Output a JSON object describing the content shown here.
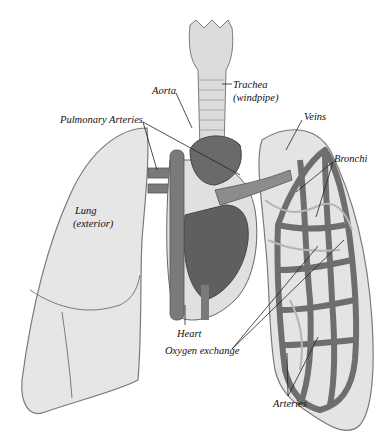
{
  "diagram": {
    "style": "grayscale anatomical illustration",
    "colors": {
      "background": "#ffffff",
      "lung_fill": "#e6e6e6",
      "lung_outline": "#7a7a7a",
      "vessel_dark": "#6e6e6e",
      "vessel_mid": "#8c8c8c",
      "heart_fill": "#5f5f5f",
      "trachea_fill": "#dcdcdc",
      "label_text": "#111111",
      "leader_line": "#222222"
    },
    "labels": {
      "aorta": "Aorta",
      "trachea": "Trachea",
      "trachea_sub": "(windpipe)",
      "pulmonary_arteries": "Pulmonary Arteries",
      "veins": "Veins",
      "bronchi": "Bronchi",
      "lung": "Lung",
      "lung_sub": "(exterior)",
      "heart": "Heart",
      "oxygen_exchange": "Oxygen exchange",
      "arteries": "Arteries"
    }
  }
}
